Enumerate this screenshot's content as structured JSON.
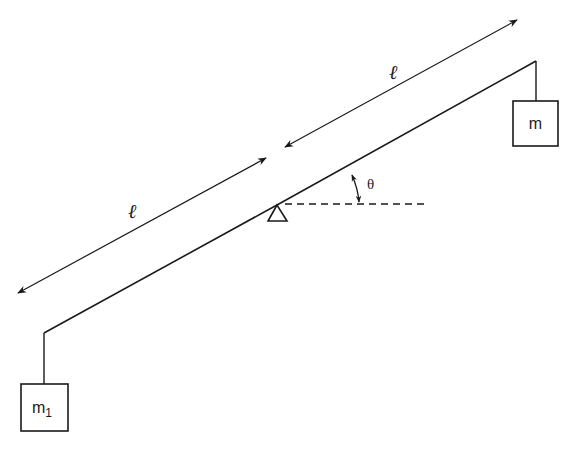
{
  "diagram": {
    "pivot": {
      "shape": "triangle",
      "x": 277,
      "y": 205
    },
    "beam": {
      "segments": [
        {
          "from": [
            44,
            333
          ],
          "to": [
            277,
            205
          ]
        },
        {
          "from": [
            277,
            205
          ],
          "to": [
            536,
            61
          ]
        }
      ]
    },
    "horizontal_reference": {
      "style": "dashed",
      "from": [
        285,
        204
      ],
      "to": [
        428,
        204
      ]
    },
    "angle": {
      "label": "θ",
      "label_pos": [
        372,
        188
      ]
    },
    "dimensions": [
      {
        "label": "ℓ",
        "from": [
          18,
          293
        ],
        "to": [
          266,
          158
        ],
        "label_pos": [
          135,
          212
        ]
      },
      {
        "label": "ℓ",
        "from": [
          285,
          147
        ],
        "to": [
          517,
          20
        ],
        "label_pos": [
          396,
          74
        ]
      }
    ],
    "masses": [
      {
        "label": "m",
        "subscript": "",
        "box": {
          "x": 513,
          "y": 101,
          "w": 45,
          "h": 45
        },
        "string_from": [
          536,
          61
        ],
        "string_to": [
          536,
          101
        ]
      },
      {
        "label": "m",
        "subscript": "1",
        "box": {
          "x": 21,
          "y": 384,
          "w": 47,
          "h": 47
        },
        "string_from": [
          44,
          333
        ],
        "string_to": [
          44,
          384
        ]
      }
    ]
  },
  "labels": {
    "theta": "θ",
    "length_upper": "ℓ",
    "length_lower": "ℓ",
    "mass_right": "m",
    "mass_left": "m",
    "mass_left_sub": "1"
  }
}
